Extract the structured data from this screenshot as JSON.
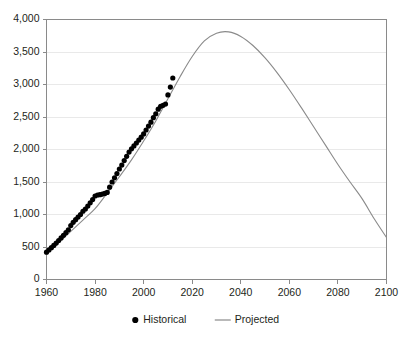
{
  "chart_data": {
    "type": "line",
    "title": "",
    "subtitle": "",
    "xlabel": "",
    "ylabel": "",
    "xlim": [
      1960,
      2100
    ],
    "ylim": [
      0,
      4000
    ],
    "grid": true,
    "legend_position": "bottom-center",
    "xticks": [
      "1960",
      "1980",
      "2000",
      "2020",
      "2040",
      "2060",
      "2080",
      "2100"
    ],
    "xtick_values": [
      1960,
      1980,
      2000,
      2020,
      2040,
      2060,
      2080,
      2100
    ],
    "yticks": [
      "0",
      "500",
      "1,000",
      "1,500",
      "2,000",
      "2,500",
      "3,000",
      "3,500",
      "4,000"
    ],
    "ytick_values": [
      0,
      500,
      1000,
      1500,
      2000,
      2500,
      3000,
      3500,
      4000
    ],
    "series": [
      {
        "name": "Historical",
        "type": "scatter",
        "marker": "circle",
        "color": "#000000",
        "x": [
          1960,
          1961,
          1962,
          1963,
          1964,
          1965,
          1966,
          1967,
          1968,
          1969,
          1970,
          1971,
          1972,
          1973,
          1974,
          1975,
          1976,
          1977,
          1978,
          1979,
          1980,
          1981,
          1982,
          1983,
          1984,
          1985,
          1986,
          1987,
          1988,
          1989,
          1990,
          1991,
          1992,
          1993,
          1994,
          1995,
          1996,
          1997,
          1998,
          1999,
          2000,
          2001,
          2002,
          2003,
          2004,
          2005,
          2006,
          2007,
          2008,
          2009,
          2010,
          2011,
          2012
        ],
        "values": [
          420,
          455,
          490,
          525,
          560,
          600,
          640,
          680,
          720,
          765,
          830,
          880,
          920,
          960,
          1000,
          1050,
          1085,
          1130,
          1180,
          1230,
          1285,
          1300,
          1305,
          1315,
          1325,
          1340,
          1420,
          1500,
          1565,
          1630,
          1700,
          1760,
          1830,
          1895,
          1960,
          2010,
          2055,
          2100,
          2145,
          2190,
          2240,
          2300,
          2360,
          2420,
          2490,
          2550,
          2620,
          2665,
          2680,
          2700,
          2840,
          2960,
          3100
        ]
      },
      {
        "name": "Projected",
        "type": "line",
        "color": "#8a8a8a",
        "x": [
          1960,
          1965,
          1970,
          1975,
          1980,
          1985,
          1990,
          1995,
          2000,
          2005,
          2010,
          2015,
          2020,
          2025,
          2030,
          2035,
          2040,
          2045,
          2050,
          2055,
          2060,
          2065,
          2070,
          2075,
          2080,
          2085,
          2090,
          2095,
          2100
        ],
        "values": [
          390,
          565,
          740,
          915,
          1090,
          1330,
          1580,
          1840,
          2130,
          2440,
          2780,
          3120,
          3430,
          3670,
          3790,
          3810,
          3740,
          3600,
          3410,
          3180,
          2920,
          2640,
          2350,
          2060,
          1770,
          1500,
          1240,
          930,
          646
        ]
      }
    ],
    "legend": [
      {
        "label": "Historical",
        "marker": "circle",
        "color": "#000000"
      },
      {
        "label": "Projected",
        "marker": "line",
        "color": "#8a8a8a"
      }
    ],
    "annotations": []
  },
  "figure": {
    "caption_cropped": ""
  }
}
